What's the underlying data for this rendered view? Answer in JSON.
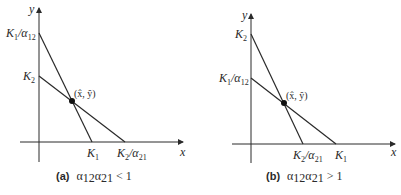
{
  "panels": [
    {
      "id": "a",
      "caption_tag": "(a)",
      "caption_expr": "α₁₂α₂₁ < 1",
      "caption_parts": {
        "a1": "α",
        "s1": "12",
        "a2": "α",
        "s2": "21",
        "rel": " < 1"
      },
      "axis_x_label": "x",
      "axis_y_label": "y",
      "y_intercepts": [
        {
          "label_main": "K",
          "label_sub": "1",
          "label_tail": "/α",
          "label_tail_sub": "12"
        },
        {
          "label_main": "K",
          "label_sub": "2"
        }
      ],
      "x_intercepts": [
        {
          "label_main": "K",
          "label_sub": "1"
        },
        {
          "label_main": "K",
          "label_sub": "2",
          "label_tail": "/α",
          "label_tail_sub": "21"
        }
      ],
      "equilibrium_label": "(x̂, ŷ)"
    },
    {
      "id": "b",
      "caption_tag": "(b)",
      "caption_expr": "α₁₂α₂₁ > 1",
      "caption_parts": {
        "a1": "α",
        "s1": "12",
        "a2": "α",
        "s2": "21",
        "rel": " > 1"
      },
      "axis_x_label": "x",
      "axis_y_label": "y",
      "y_intercepts": [
        {
          "label_main": "K",
          "label_sub": "2"
        },
        {
          "label_main": "K",
          "label_sub": "1",
          "label_tail": "/α",
          "label_tail_sub": "12"
        }
      ],
      "x_intercepts": [
        {
          "label_main": "K",
          "label_sub": "2",
          "label_tail": "/α",
          "label_tail_sub": "21"
        },
        {
          "label_main": "K",
          "label_sub": "1"
        }
      ],
      "equilibrium_label": "(x̂, ŷ)"
    }
  ],
  "colors": {
    "ink": "#2a2a2a",
    "background": "#ffffff"
  }
}
